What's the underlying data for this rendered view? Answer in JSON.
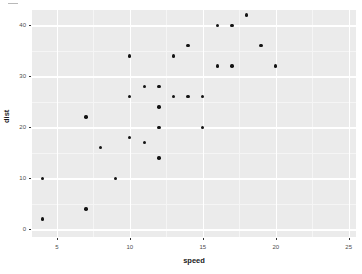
{
  "chart_data": {
    "type": "scatter",
    "title": "",
    "xlabel": "speed",
    "ylabel": "dist",
    "xlim": [
      3.3,
      25.5
    ],
    "ylim": [
      -1.5,
      43
    ],
    "grid": true,
    "legend": null,
    "x_ticks": [
      5,
      10,
      15,
      20,
      25
    ],
    "y_ticks": [
      0,
      10,
      20,
      30,
      40
    ],
    "x_tick_labels": [
      "5",
      "10",
      "15",
      "20",
      "25"
    ],
    "y_tick_labels": [
      "0",
      "10",
      "20",
      "30",
      "40"
    ],
    "x_minor_ticks": [
      7.5,
      12.5,
      17.5,
      22.5
    ],
    "y_minor_ticks": [
      5,
      15,
      25,
      35
    ],
    "point_color": "#131313",
    "panel_color": "#ebebeb",
    "grid_color": "#ffffff",
    "points": [
      {
        "x": 4,
        "y": 2
      },
      {
        "x": 4,
        "y": 10
      },
      {
        "x": 7,
        "y": 4
      },
      {
        "x": 7,
        "y": 22
      },
      {
        "x": 8,
        "y": 16
      },
      {
        "x": 9,
        "y": 10
      },
      {
        "x": 10,
        "y": 18
      },
      {
        "x": 10,
        "y": 26
      },
      {
        "x": 10,
        "y": 34
      },
      {
        "x": 11,
        "y": 17
      },
      {
        "x": 11,
        "y": 28
      },
      {
        "x": 12,
        "y": 14
      },
      {
        "x": 12,
        "y": 20
      },
      {
        "x": 12,
        "y": 24
      },
      {
        "x": 12,
        "y": 28
      },
      {
        "x": 13,
        "y": 26
      },
      {
        "x": 13,
        "y": 34
      },
      {
        "x": 14,
        "y": 26
      },
      {
        "x": 14,
        "y": 36
      },
      {
        "x": 15,
        "y": 20
      },
      {
        "x": 15,
        "y": 26
      },
      {
        "x": 16,
        "y": 32
      },
      {
        "x": 16,
        "y": 40
      },
      {
        "x": 17,
        "y": 32
      },
      {
        "x": 17,
        "y": 40
      },
      {
        "x": 18,
        "y": 42
      },
      {
        "x": 19,
        "y": 36
      },
      {
        "x": 20,
        "y": 32
      }
    ]
  },
  "axes": {
    "x_title": "speed",
    "y_title": "dist"
  }
}
